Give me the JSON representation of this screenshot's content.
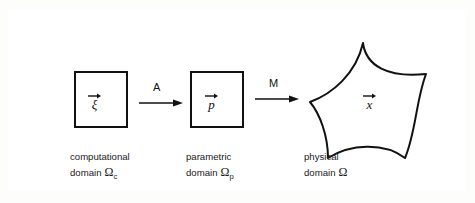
{
  "domains": [
    {
      "id": "computational",
      "shape": "square",
      "variable": "ξ",
      "variable_is_vector": true,
      "caption_line1": "computational",
      "caption_line2": "domain",
      "symbol": "Ω",
      "subscript": "c"
    },
    {
      "id": "parametric",
      "shape": "square",
      "variable": "p",
      "variable_is_vector": true,
      "caption_line1": "parametric",
      "caption_line2": "domain",
      "symbol": "Ω",
      "subscript": "p"
    },
    {
      "id": "physical",
      "shape": "curved-quadrilateral",
      "variable": "x",
      "variable_is_vector": true,
      "caption_line1": "physical",
      "caption_line2": "domain",
      "symbol": "Ω",
      "subscript": ""
    }
  ],
  "maps": [
    {
      "id": "map-a",
      "label": "A",
      "from": "computational",
      "to": "parametric",
      "icon": "arrow-right-icon"
    },
    {
      "id": "map-m",
      "label": "M",
      "from": "parametric",
      "to": "physical",
      "icon": "arrow-right-icon"
    }
  ],
  "colors": {
    "stroke": "#111111",
    "frame": "#2b2b2b",
    "background": "#ffffff",
    "text": "#1a1a1a"
  }
}
